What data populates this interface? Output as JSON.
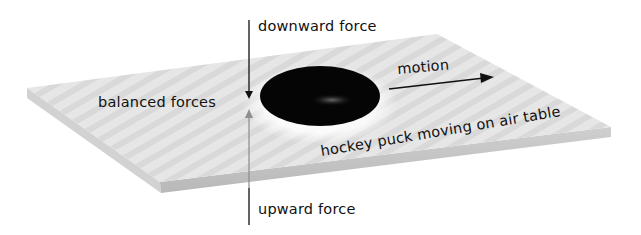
{
  "diagram": {
    "labels": {
      "downward_force": "downward force",
      "balanced_forces": "balanced forces",
      "motion": "motion",
      "puck_caption": "hockey puck moving on air table",
      "upward_force": "upward force"
    },
    "colors": {
      "table_top": "#e4e4e4",
      "table_edge": "#c4c4c4",
      "puck": "#050505",
      "arrow_down": "#222222",
      "arrow_up": "#8a8a8a",
      "text": "#111111"
    }
  }
}
